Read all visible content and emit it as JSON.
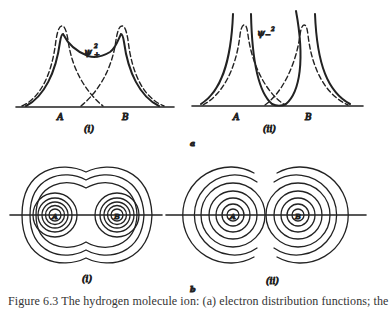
{
  "figure": {
    "panel_a": {
      "label": "a",
      "subfigures": [
        {
          "id": "i",
          "label": "(i)",
          "curve_label": "ψ₊²",
          "nuclei": [
            "A",
            "B"
          ],
          "description": "bonding: dashed atomic densities summing to solid ψ+² with density between nuclei"
        },
        {
          "id": "ii",
          "label": "(ii)",
          "curve_label": "ψ₋²",
          "nuclei": [
            "A",
            "B"
          ],
          "description": "antibonding: solid ψ−² drops to zero between nuclei"
        }
      ]
    },
    "panel_b": {
      "label": "b",
      "subfigures": [
        {
          "id": "i",
          "label": "(i)",
          "nuclei": [
            "A",
            "B"
          ],
          "description": "contour map enveloping both nuclei"
        },
        {
          "id": "ii",
          "label": "(ii)",
          "nuclei": [
            "A",
            "B"
          ],
          "description": "separate contour sets around each nucleus"
        }
      ]
    },
    "caption": "Figure 6.3   The hydrogen molecule ion: (a) electron distribution functions; the"
  },
  "colors": {
    "ink": "#222222",
    "background": "#ffffff"
  }
}
